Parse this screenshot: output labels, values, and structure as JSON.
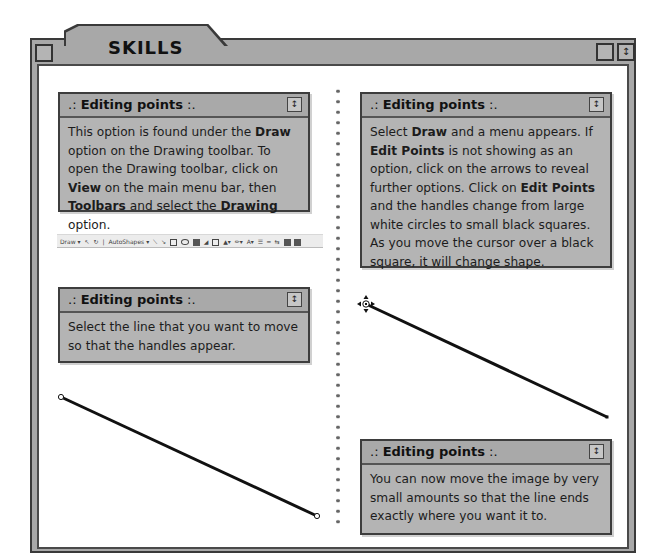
{
  "window": {
    "title": "SKILLS",
    "left_button_icon": "window-box-icon",
    "right_buttons": [
      {
        "icon": "collapse-box-icon",
        "glyph": ""
      },
      {
        "icon": "up-down-arrows-icon",
        "glyph": "↕"
      }
    ]
  },
  "panels": [
    {
      "prefix": ".:",
      "title": "Editing points",
      "suffix": ":.",
      "spin_glyph": "↕",
      "segments": [
        {
          "t": "This option is found under the ",
          "b": false
        },
        {
          "t": "Draw",
          "b": true
        },
        {
          "t": " option on the Drawing toolbar. To open the Drawing toolbar, click on ",
          "b": false
        },
        {
          "t": "View",
          "b": true
        },
        {
          "t": " on the main menu bar, then ",
          "b": false
        },
        {
          "t": "Toolbars",
          "b": true
        },
        {
          "t": " and select the ",
          "b": false
        },
        {
          "t": "Drawing",
          "b": true
        },
        {
          "t": " option.",
          "b": false
        }
      ]
    },
    {
      "prefix": ".:",
      "title": "Editing points",
      "suffix": ":.",
      "spin_glyph": "↕",
      "segments": [
        {
          "t": "Select the line that you want to move so that the handles appear.",
          "b": false
        }
      ]
    },
    {
      "prefix": ".:",
      "title": "Editing points",
      "suffix": ":.",
      "spin_glyph": "↕",
      "segments": [
        {
          "t": "Select ",
          "b": false
        },
        {
          "t": "Draw",
          "b": true
        },
        {
          "t": " and a menu appears. If ",
          "b": false
        },
        {
          "t": "Edit Points",
          "b": true
        },
        {
          "t": " is not showing as an option, click on the arrows to reveal further options. Click on ",
          "b": false
        },
        {
          "t": "Edit Points",
          "b": true
        },
        {
          "t": " and the handles change from large white circles to small black squares. As you move the cursor over a black square, it will change shape.",
          "b": false
        }
      ]
    },
    {
      "prefix": ".:",
      "title": "Editing points",
      "suffix": ":.",
      "spin_glyph": "↕",
      "segments": [
        {
          "t": "You can now move the image by very small amounts so that the line ends exactly where you want it to.",
          "b": false
        }
      ]
    }
  ],
  "toolbar": {
    "draw_label": "Draw ▾",
    "autoshapes_label": "AutoShapes ▾"
  },
  "illustrations": {
    "left_line": {
      "x1": 61,
      "y1": 397,
      "x2": 317,
      "y2": 516,
      "handle": "white-circle"
    },
    "right_line": {
      "x1": 366,
      "y1": 304,
      "x2": 607,
      "y2": 417,
      "handle": "black-square",
      "cursor": "move-cursor"
    }
  }
}
